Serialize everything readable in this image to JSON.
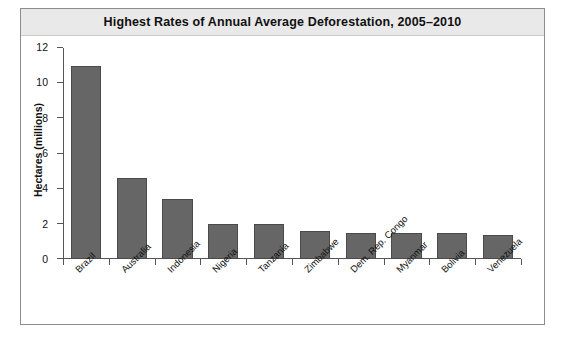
{
  "chart_data": {
    "type": "bar",
    "title": "Highest Rates of Annual Average Deforestation, 2005–2010",
    "xlabel": "",
    "ylabel": "Hectares (millions)",
    "categories": [
      "Brazil",
      "Australia",
      "Indonesia",
      "Nigeria",
      "Tanzania",
      "Zimbabwe",
      "Dem. Rep. Congo",
      "Myanmar",
      "Bolivia",
      "Venezuela"
    ],
    "values": [
      11.0,
      4.6,
      3.4,
      2.0,
      2.0,
      1.6,
      1.5,
      1.5,
      1.5,
      1.35
    ],
    "ylim": [
      0,
      12
    ],
    "yticks": [
      0,
      2,
      4,
      6,
      8,
      10,
      12
    ],
    "ytick_labels": [
      "0",
      "2",
      "4",
      "6",
      "8",
      "10",
      "12"
    ],
    "grid": false,
    "legend": null,
    "bar_color": "#666666",
    "bar_edge_color": "#4a4a4a",
    "title_band_color": "#e9e9e9",
    "frame_color": "#8c8c8c",
    "axis_color": "#555555",
    "background": "#ffffff"
  }
}
